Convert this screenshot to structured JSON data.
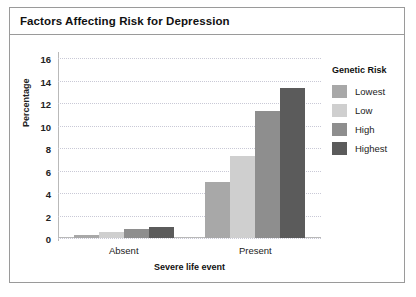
{
  "figure": {
    "title": "Factors Affecting Risk for Depression"
  },
  "legend": {
    "title": "Genetic Risk",
    "entries": [
      {
        "label": "Lowest",
        "color": "#a8a8a8"
      },
      {
        "label": "Low",
        "color": "#cfcfcf"
      },
      {
        "label": "High",
        "color": "#8e8e8e"
      },
      {
        "label": "Highest",
        "color": "#5b5b5b"
      }
    ]
  },
  "chart_data": {
    "type": "bar",
    "title": "Factors Affecting Risk for Depression",
    "xlabel": "Severe life event",
    "ylabel": "Percentage",
    "categories": [
      "Absent",
      "Present"
    ],
    "ylim": [
      0,
      16
    ],
    "yticks": [
      0,
      2,
      4,
      6,
      8,
      10,
      12,
      14,
      16
    ],
    "grid": true,
    "legend_position": "right",
    "series": [
      {
        "name": "Lowest",
        "color": "#a8a8a8",
        "values": [
          0.3,
          5.0
        ]
      },
      {
        "name": "Low",
        "color": "#cfcfcf",
        "values": [
          0.5,
          7.3
        ]
      },
      {
        "name": "High",
        "color": "#8e8e8e",
        "values": [
          0.8,
          11.3
        ]
      },
      {
        "name": "Highest",
        "color": "#5b5b5b",
        "values": [
          1.0,
          13.3
        ]
      }
    ]
  }
}
